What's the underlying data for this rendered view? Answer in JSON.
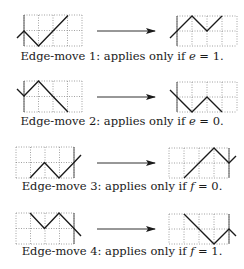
{
  "colors": {
    "ink": "#1a1a1a",
    "grid": "#8a8a8a",
    "border": "#555555"
  },
  "panels": [
    {
      "caption": {
        "prefix": "Edge-move 1: applies only if ",
        "var": "e",
        "suffix": " = 1."
      },
      "caption_y": 49,
      "left": {
        "grid": {
          "x": 24,
          "y": 15,
          "cols": 4,
          "rows": 2,
          "cw": 14.5,
          "rh": 15.5,
          "solid": "left"
        },
        "path": "17,38 24,31 38.5,46 53,31 68,15.5"
      },
      "right": {
        "grid": {
          "x": 177,
          "y": 16,
          "cols": 4,
          "rows": 2,
          "cw": 15,
          "rh": 15,
          "solid": "left"
        },
        "path": "170,38 177,31 192,16 207,31 222,16"
      },
      "arrow_y": 31
    },
    {
      "caption": {
        "prefix": "Edge-move 2: applies only if ",
        "var": "e",
        "suffix": " = 0."
      },
      "caption_y": 114,
      "left": {
        "grid": {
          "x": 24,
          "y": 81,
          "cols": 4,
          "rows": 2,
          "cw": 14.5,
          "rh": 15.5,
          "solid": "left"
        },
        "path": "17,89 24,96 38.5,81 53,96.5 68,112"
      },
      "right": {
        "grid": {
          "x": 177,
          "y": 82,
          "cols": 4,
          "rows": 2,
          "cw": 15,
          "rh": 15,
          "solid": "left"
        },
        "path": "170,90 177,97 192,112 207,97 222,112"
      },
      "arrow_y": 97
    },
    {
      "caption": {
        "prefix": "Edge-move 3: applies only if ",
        "var": "f",
        "suffix": " = 0."
      },
      "caption_y": 179,
      "left": {
        "grid": {
          "x": 16,
          "y": 147,
          "cols": 4,
          "rows": 2,
          "cw": 14.5,
          "rh": 15.5,
          "solid": "right"
        },
        "path": "30,178 44.5,162.5 59,178 74,162.5 81,155"
      },
      "right": {
        "grid": {
          "x": 169,
          "y": 148,
          "cols": 4,
          "rows": 2,
          "cw": 15,
          "rh": 15,
          "solid": "right"
        },
        "path": "184,178 199,163 214,148 229,163 236,156"
      },
      "arrow_y": 163
    },
    {
      "caption": {
        "prefix": "Edge-move 4: applies only if ",
        "var": "f",
        "suffix": " = 1."
      },
      "caption_y": 244,
      "left": {
        "grid": {
          "x": 16,
          "y": 213,
          "cols": 4,
          "rows": 2,
          "cw": 14.5,
          "rh": 15.5,
          "solid": "right"
        },
        "path": "30,213 44.5,228.5 59,213 74,228.5 81,236"
      },
      "right": {
        "grid": {
          "x": 169,
          "y": 214,
          "cols": 4,
          "rows": 2,
          "cw": 15,
          "rh": 15,
          "solid": "right"
        },
        "path": "184,214 199,229 214,244 229,229 236,236"
      },
      "arrow_y": 229
    }
  ],
  "arrow": {
    "x1": 97,
    "x2": 155
  }
}
